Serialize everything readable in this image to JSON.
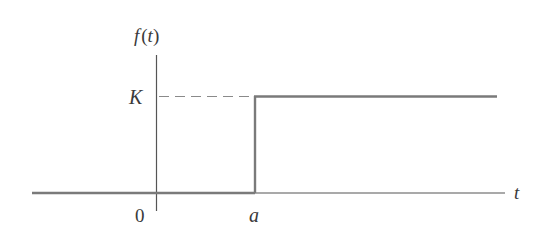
{
  "diagram": {
    "type": "step-function-graph",
    "function_label": "f (t)",
    "function_label_parts": {
      "f": "f",
      "open": "(",
      "t": "t",
      "close": ")"
    },
    "y_level_label": "K",
    "origin_label": "0",
    "step_point_label": "a",
    "x_axis_label": "t",
    "colors": {
      "axis": "#555555",
      "function": "#7a7a7a",
      "dashed": "#8a8a8a",
      "text": "#3a3a3a"
    }
  }
}
